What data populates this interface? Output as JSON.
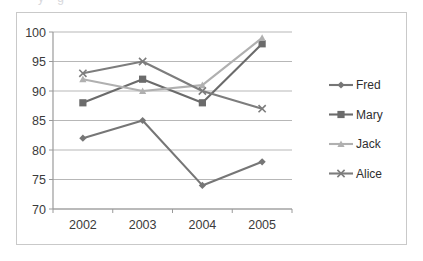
{
  "chart_data": {
    "type": "line",
    "title": "",
    "subtitle": "",
    "xlabel": "",
    "ylabel": "",
    "categories": [
      "2002",
      "2003",
      "2004",
      "2005"
    ],
    "ylim": [
      70,
      100
    ],
    "yticks": [
      70,
      75,
      80,
      85,
      90,
      95,
      100
    ],
    "ytick_labels": [
      "70",
      "75",
      "80",
      "85",
      "90",
      "95",
      "100"
    ],
    "grid": true,
    "legend_position": "right",
    "series": [
      {
        "name": "Fred",
        "marker": "diamond",
        "color": "#767676",
        "values": [
          82,
          85,
          74,
          78
        ]
      },
      {
        "name": "Mary",
        "marker": "square",
        "color": "#6b6b6b",
        "values": [
          88,
          92,
          88,
          98
        ]
      },
      {
        "name": "Jack",
        "marker": "triangle",
        "color": "#b0b0b0",
        "values": [
          92,
          90,
          91,
          99
        ]
      },
      {
        "name": "Alice",
        "marker": "x",
        "color": "#7d7d7d",
        "values": [
          93,
          95,
          90,
          87
        ]
      }
    ]
  },
  "legend": {
    "entries": [
      {
        "label": "Fred"
      },
      {
        "label": "Mary"
      },
      {
        "label": "Jack"
      },
      {
        "label": "Alice"
      }
    ]
  },
  "axes": {
    "y_tick_0": "100",
    "y_tick_1": "95",
    "y_tick_2": "90",
    "y_tick_3": "85",
    "y_tick_4": "80",
    "y_tick_5": "75",
    "y_tick_6": "70",
    "x_tick_0": "2002",
    "x_tick_1": "2003",
    "x_tick_2": "2004",
    "x_tick_3": "2005"
  },
  "colors": {
    "grid": "#b7b7b7",
    "axis": "#8a8a8a",
    "frame": "#c9c9c9",
    "background": "#ffffff",
    "text": "#3b3b3b"
  },
  "top_sliver_text": "y      g"
}
